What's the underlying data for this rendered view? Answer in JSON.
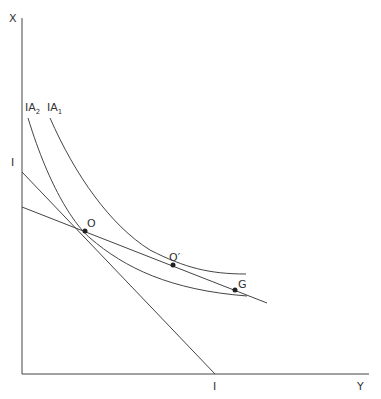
{
  "diagram": {
    "axes": {
      "vertical_label": "X",
      "horizontal_label": "Y"
    },
    "budget_intercepts": {
      "vertical": "I",
      "horizontal": "I"
    },
    "curves": [
      {
        "name": "IA",
        "subscript": "2"
      },
      {
        "name": "IA",
        "subscript": "1"
      }
    ],
    "points": {
      "O": "O",
      "O_prime": "O′",
      "G": "G"
    }
  }
}
